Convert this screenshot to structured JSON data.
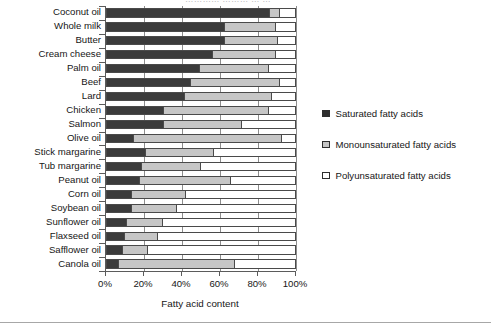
{
  "figure": {
    "title_sliver": "…………   ………  …   …",
    "xlabel": "Fatty acid content"
  },
  "legend": {
    "items": [
      {
        "label": "Saturated fatty acids",
        "color": "#2e2e2e",
        "swatch": "sw-sat"
      },
      {
        "label": "Monounsaturated fatty acids",
        "color": "#c6c6c6",
        "swatch": "sw-mono"
      },
      {
        "label": "Polyunsaturated fatty acids",
        "color": "#ffffff",
        "swatch": "sw-poly"
      }
    ]
  },
  "axis": {
    "ticks": [
      "0%",
      "20%",
      "40%",
      "60%",
      "80%",
      "100%"
    ],
    "tick_values": [
      0,
      20,
      40,
      60,
      80,
      100
    ]
  },
  "chart_data": {
    "type": "bar",
    "orientation": "horizontal",
    "stacked": true,
    "title": "",
    "xlabel": "Fatty acid content",
    "ylabel": "",
    "xlim": [
      0,
      100
    ],
    "xticks": [
      0,
      20,
      40,
      60,
      80,
      100
    ],
    "xticklabels": [
      "0%",
      "20%",
      "40%",
      "60%",
      "80%",
      "100%"
    ],
    "grid": "vertical",
    "legend_position": "right",
    "units": "percent",
    "categories": [
      "Coconut oil",
      "Whole milk",
      "Butter",
      "Cream cheese",
      "Palm oil",
      "Beef",
      "Lard",
      "Chicken",
      "Salmon",
      "Olive oil",
      "Stick margarine",
      "Tub margarine",
      "Peanut oil",
      "Corn oil",
      "Soybean oil",
      "Sunflower oil",
      "Flaxseed oil",
      "Safflower oil",
      "Canola oil"
    ],
    "series": [
      {
        "name": "Saturated fatty acids",
        "color": "#3b3b3b",
        "values": [
          86,
          62,
          62,
          56,
          49,
          44,
          41,
          30,
          30,
          14,
          20,
          18,
          17,
          13,
          13,
          10,
          9,
          8,
          6
        ]
      },
      {
        "name": "Monounsaturated fatty acids",
        "color": "#c6c6c6",
        "values": [
          6,
          28,
          29,
          34,
          37,
          48,
          47,
          56,
          42,
          79,
          37,
          32,
          49,
          29,
          24,
          20,
          18,
          14,
          62
        ]
      },
      {
        "name": "Polyunsaturated fatty acids",
        "color": "#ffffff",
        "values": [
          8,
          10,
          9,
          10,
          14,
          8,
          12,
          14,
          28,
          7,
          43,
          50,
          34,
          58,
          63,
          70,
          73,
          78,
          32
        ]
      }
    ]
  }
}
